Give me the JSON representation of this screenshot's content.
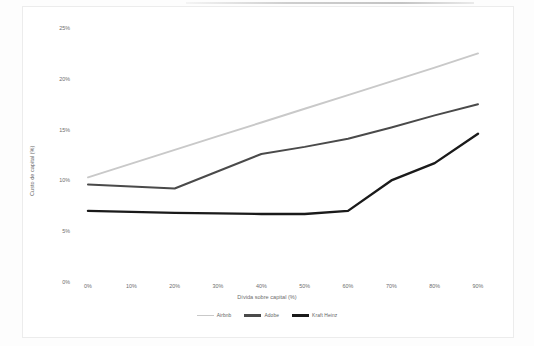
{
  "chart_data": {
    "type": "line",
    "title": "",
    "xlabel": "Dívida sobre capital (%)",
    "ylabel": "Custo de capital (%)",
    "x": [
      0,
      10,
      20,
      30,
      40,
      50,
      60,
      70,
      80,
      90
    ],
    "x_tick_labels": [
      "0%",
      "10%",
      "20%",
      "30%",
      "40%",
      "50%",
      "60%",
      "70%",
      "80%",
      "90%"
    ],
    "y_tick_labels": [
      "0%",
      "5%",
      "10%",
      "15%",
      "20%",
      "25%"
    ],
    "y_ticks": [
      0,
      5,
      10,
      15,
      20,
      25
    ],
    "xlim": [
      0,
      90
    ],
    "ylim": [
      0,
      25
    ],
    "grid": false,
    "legend_position": "bottom",
    "series": [
      {
        "name": "Airbnb",
        "color": "#c9c9c9",
        "width": 1.9,
        "values": [
          10.3,
          11.65,
          13.0,
          14.35,
          15.7,
          17.05,
          18.4,
          19.75,
          21.1,
          22.5
        ]
      },
      {
        "name": "Adobe",
        "color": "#4a4a4a",
        "width": 2.0,
        "values": [
          9.6,
          9.4,
          9.2,
          10.9,
          12.6,
          13.3,
          14.1,
          15.2,
          16.4,
          17.5
        ]
      },
      {
        "name": "Kraft Heinz",
        "color": "#1a1a1a",
        "width": 2.4,
        "values": [
          7.0,
          6.9,
          6.8,
          6.75,
          6.7,
          6.7,
          7.0,
          10.0,
          11.7,
          14.6
        ]
      }
    ]
  },
  "legend": {
    "items": [
      {
        "label": "Airbnb",
        "color": "#c9c9c9"
      },
      {
        "label": "Adobe",
        "color": "#4a4a4a"
      },
      {
        "label": "Kraft Heinz",
        "color": "#1a1a1a"
      }
    ]
  },
  "axes": {
    "x_title": "Dívida sobre capital (%)",
    "y_title": "Custo de capital (%)"
  }
}
